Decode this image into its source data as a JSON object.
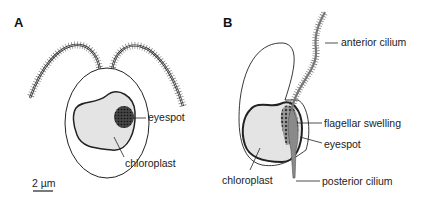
{
  "panels": [
    {
      "id": "A",
      "label": "A",
      "annotations": [
        "eyespot",
        "chloroplast"
      ],
      "scale_bar": "2 µm"
    },
    {
      "id": "B",
      "label": "B",
      "annotations": [
        "anterior cilium",
        "flagellar swelling",
        "eyespot",
        "chloroplast",
        "posterior cilium"
      ]
    }
  ],
  "colors": {
    "outline": "#222222",
    "chloroplast_fill": "#e4e4e4",
    "eyespot_fill": "#333333",
    "cilium_fill": "#888888"
  }
}
